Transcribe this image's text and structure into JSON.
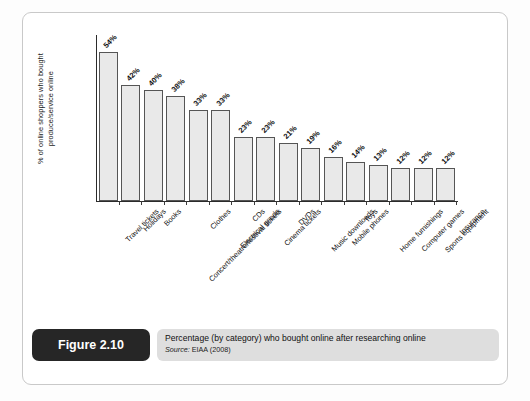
{
  "figure": {
    "tag": "Figure 2.10",
    "caption": "Percentage (by category) who bought online after researching online",
    "source_label": "Source:",
    "source_value": " EIAA (2008)"
  },
  "chart_data": {
    "type": "bar",
    "title": "Percentage (by category) who bought online after researching online",
    "xlabel": "",
    "ylabel": "% of online shoppers who bought produce/service online",
    "ylabel_line1": "% of online shoppers who bought",
    "ylabel_line2": "produce/service online",
    "ylim": [
      0,
      60
    ],
    "grid": false,
    "legend": "none",
    "value_suffix": "%",
    "bar_fill": "#e9e9e9",
    "bar_stroke": "#555555",
    "categories": [
      "Travel tickets",
      "Holidays",
      "Books",
      "Concert/theatre/festival tickets",
      "Clothes",
      "Electrical goods",
      "CDs",
      "Cinema tickets",
      "DVDs",
      "Music downloads",
      "Mobile phones",
      "Toys",
      "Home furnishings",
      "Computer games",
      "Sports equipment",
      "Insurance"
    ],
    "values": [
      54,
      42,
      40,
      38,
      33,
      33,
      23,
      23,
      21,
      19,
      16,
      14,
      13,
      12,
      12,
      12
    ],
    "value_labels": [
      "54%",
      "42%",
      "40%",
      "38%",
      "33%",
      "33%",
      "23%",
      "23%",
      "21%",
      "19%",
      "16%",
      "14%",
      "13%",
      "12%",
      "12%",
      "12%"
    ]
  }
}
